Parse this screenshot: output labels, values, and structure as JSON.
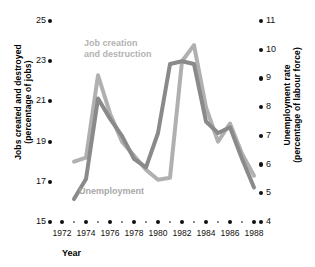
{
  "chart_data": {
    "type": "line",
    "title": "",
    "xlabel": "Year",
    "x": [
      1972,
      1973,
      1974,
      1975,
      1976,
      1977,
      1978,
      1979,
      1980,
      1981,
      1982,
      1983,
      1984,
      1985,
      1986,
      1987,
      1988
    ],
    "xticks_major": [
      1972,
      1974,
      1976,
      1978,
      1980,
      1982,
      1984,
      1986,
      1988
    ],
    "xticks_minor": [
      1973,
      1975,
      1977,
      1979,
      1981,
      1983,
      1985,
      1987
    ],
    "xlim": [
      1971,
      1989
    ],
    "grid": false,
    "legend_position": "inline-annotations",
    "axes": {
      "left": {
        "label": "Jobs created and destroyed (percentage of jobs)",
        "ticks": [
          15,
          17,
          19,
          21,
          23,
          25
        ],
        "lim": [
          15,
          25
        ]
      },
      "right": {
        "label": "Unemployment rate (percentage of labour force)",
        "ticks": [
          4,
          5,
          6,
          7,
          8,
          9,
          10,
          11
        ],
        "lim": [
          4,
          11
        ]
      }
    },
    "series": [
      {
        "name": "Job creation and destruction",
        "axis": "left",
        "color": "#b0b0b0",
        "x": [
          1973,
          1974,
          1975,
          1976,
          1977,
          1978,
          1979,
          1980,
          1981,
          1982,
          1983,
          1984,
          1985,
          1986,
          1987,
          1988
        ],
        "values": [
          18.0,
          18.2,
          22.3,
          20.4,
          19.0,
          18.3,
          17.6,
          17.1,
          17.2,
          23.0,
          23.8,
          20.7,
          19.0,
          19.9,
          18.4,
          17.3
        ]
      },
      {
        "name": "Unemployment",
        "axis": "right",
        "color": "#8a8a8a",
        "x": [
          1973,
          1974,
          1975,
          1976,
          1977,
          1978,
          1979,
          1980,
          1981,
          1982,
          1983,
          1984,
          1985,
          1986,
          1987,
          1988
        ],
        "values": [
          4.8,
          5.5,
          8.3,
          7.6,
          7.0,
          6.2,
          5.9,
          7.1,
          9.5,
          9.6,
          9.5,
          7.5,
          7.1,
          7.3,
          6.2,
          5.2
        ]
      }
    ],
    "annotations": [
      {
        "name": "Job creation and destruction",
        "line1": "Job creation",
        "line2": "and destruction"
      },
      {
        "name": "Unemployment",
        "line1": "Unemployment",
        "line2": ""
      }
    ]
  },
  "labels": {
    "y_left_line1": "Jobs created and destroyed",
    "y_left_line2": "(percentage of jobs)",
    "y_right_line1": "Unemployment rate",
    "y_right_line2": "(percentage of labour force)",
    "x_title": "Year",
    "series_jobs_line1": "Job creation",
    "series_jobs_line2": "and destruction",
    "series_unemployment": "Unemployment"
  },
  "colors": {
    "jobs": "#b0b0b0",
    "unemployment": "#8a8a8a",
    "text": "#111111",
    "background": "#ffffff"
  }
}
